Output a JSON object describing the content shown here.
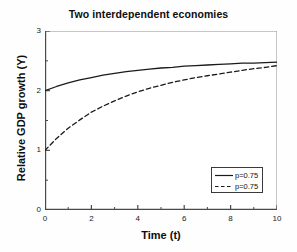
{
  "chart_data": {
    "type": "line",
    "title": "Two interdependent economies",
    "xlabel": "Time (t)",
    "ylabel": "Relative GDP growth (Y)",
    "xlim": [
      0,
      10
    ],
    "ylim": [
      0,
      3
    ],
    "grid": false,
    "legend_position": "lower right",
    "xticks": [
      0,
      2,
      4,
      6,
      8,
      10
    ],
    "xtick_labels": [
      "0",
      "2",
      "4",
      "6",
      "8",
      "10"
    ],
    "x_minor_ticks": [
      1,
      3,
      5,
      7,
      9
    ],
    "yticks": [
      0,
      1,
      2,
      3
    ],
    "ytick_labels": [
      "0",
      "1",
      "2",
      "3"
    ],
    "y_minor_ticks": [
      0.5,
      1.5,
      2.5
    ],
    "x": [
      0,
      0.5,
      1,
      1.5,
      2,
      2.5,
      3,
      3.5,
      4,
      4.5,
      5,
      5.5,
      6,
      6.5,
      7,
      7.5,
      8,
      8.5,
      9,
      9.5,
      10
    ],
    "series": [
      {
        "name": "p=0.75",
        "style": "solid",
        "color": "#1a1a1a",
        "values": [
          2.0,
          2.07,
          2.13,
          2.18,
          2.22,
          2.26,
          2.29,
          2.32,
          2.34,
          2.36,
          2.38,
          2.39,
          2.41,
          2.42,
          2.43,
          2.44,
          2.45,
          2.46,
          2.46,
          2.47,
          2.48
        ]
      },
      {
        "name": "p=0.75",
        "style": "dashed",
        "color": "#1a1a1a",
        "values": [
          1.0,
          1.2,
          1.37,
          1.51,
          1.64,
          1.74,
          1.83,
          1.91,
          1.98,
          2.04,
          2.09,
          2.14,
          2.18,
          2.22,
          2.25,
          2.28,
          2.31,
          2.34,
          2.37,
          2.39,
          2.42
        ]
      }
    ]
  },
  "legend": {
    "entries": [
      {
        "label": "p=0.75",
        "style": "solid"
      },
      {
        "label": "p=0.75",
        "style": "dashed"
      }
    ]
  },
  "colors": {
    "axis": "#4a4a4a",
    "line": "#1a1a1a",
    "background": "#ffffff"
  }
}
